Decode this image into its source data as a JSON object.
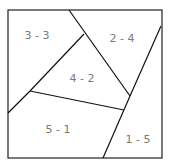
{
  "diagram": {
    "type": "partitioned-square",
    "regions": [
      {
        "label": "3 - 3",
        "x": 37,
        "y": 39
      },
      {
        "label": "2 - 4",
        "x": 122,
        "y": 42
      },
      {
        "label": "4 - 2",
        "x": 82,
        "y": 82
      },
      {
        "label": "5 - 1",
        "x": 58,
        "y": 133
      },
      {
        "label": "1 - 5",
        "x": 138,
        "y": 143
      }
    ],
    "colors": {
      "line": "#111111",
      "text": "#7a7a7a",
      "background": "#ffffff"
    }
  }
}
